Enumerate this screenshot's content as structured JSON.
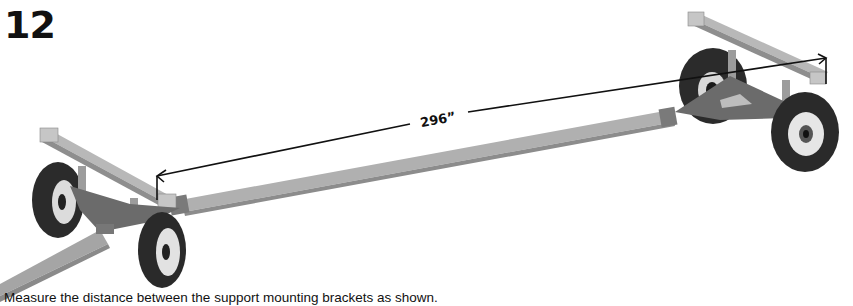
{
  "step": {
    "number": "12"
  },
  "illustration": {
    "subject": "wagon running gear with front and rear axle assemblies connected by reach tube",
    "dimension": {
      "label": "296”",
      "description": "distance between support mounting brackets"
    },
    "colors": {
      "tube": "#a9a9a9",
      "frame": "#6e6e6e",
      "tire": "#2a2a2a",
      "rim": "#e6e6e6",
      "bracket": "#c8c8c8",
      "dimension_line": "#111111"
    }
  },
  "caption": {
    "text": "Measure the distance between the support mounting brackets as shown."
  }
}
